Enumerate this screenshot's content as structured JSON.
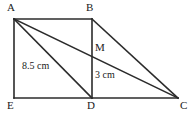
{
  "figure": {
    "stroke_color": "#2b2b2b",
    "background_color": "#ffffff",
    "vertices": [
      {
        "name": "A",
        "label": "A",
        "x": 14,
        "y": 19
      },
      {
        "name": "B",
        "label": "B",
        "x": 92,
        "y": 19
      },
      {
        "name": "M",
        "label": "M",
        "x": 92,
        "y": 47
      },
      {
        "name": "E",
        "label": "E",
        "x": 14,
        "y": 98
      },
      {
        "name": "D",
        "label": "D",
        "x": 92,
        "y": 98
      },
      {
        "name": "C",
        "label": "C",
        "x": 178,
        "y": 98
      }
    ],
    "segments": [
      {
        "name": "AB",
        "from": "A",
        "to": "B"
      },
      {
        "name": "AE",
        "from": "A",
        "to": "E"
      },
      {
        "name": "EC",
        "from": "E",
        "to": "C"
      },
      {
        "name": "BD",
        "from": "B",
        "to": "D"
      },
      {
        "name": "AD",
        "from": "A",
        "to": "D"
      },
      {
        "name": "AC",
        "from": "A",
        "to": "C"
      },
      {
        "name": "BC",
        "from": "B",
        "to": "C"
      }
    ],
    "measurements": [
      {
        "name": "ad-length",
        "label": "8.5 cm",
        "value": 8.5,
        "unit": "cm",
        "applies_to": "AD"
      },
      {
        "name": "md-length",
        "label": "3 cm",
        "value": 3,
        "unit": "cm",
        "applies_to": "MD"
      }
    ]
  }
}
